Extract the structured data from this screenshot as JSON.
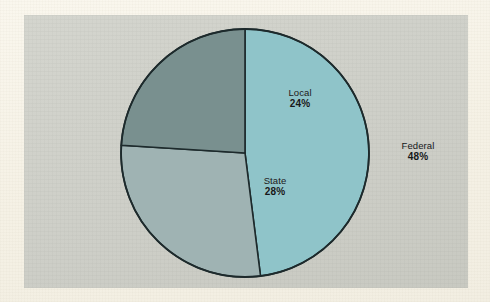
{
  "figure": {
    "panel_background": "#cfd0c9",
    "page_background": "#f7f3e9",
    "outline_color": "#1d2a2c"
  },
  "chart_data": {
    "type": "pie",
    "title": "",
    "subtitle": "",
    "xlabel": "",
    "ylabel": "",
    "legend_position": "none",
    "grid": false,
    "units": "percent",
    "start_angle_deg": 0,
    "direction": "clockwise",
    "categories": [
      "Federal",
      "State",
      "Local"
    ],
    "values": [
      48,
      28,
      24
    ],
    "colors": [
      "#8fc4c9",
      "#9fb3b3",
      "#79908f"
    ],
    "slices": [
      {
        "name": "Federal",
        "label": "Federal",
        "value": 48,
        "value_text": "48%",
        "color": "#8fc4c9",
        "start_deg": 0,
        "end_deg": 172.8
      },
      {
        "name": "State",
        "label": "State",
        "value": 28,
        "value_text": "28%",
        "color": "#9fb3b3",
        "start_deg": 172.8,
        "end_deg": 273.6
      },
      {
        "name": "Local",
        "label": "Local",
        "value": 24,
        "value_text": "24%",
        "color": "#79908f",
        "start_deg": 273.6,
        "end_deg": 360
      }
    ]
  }
}
